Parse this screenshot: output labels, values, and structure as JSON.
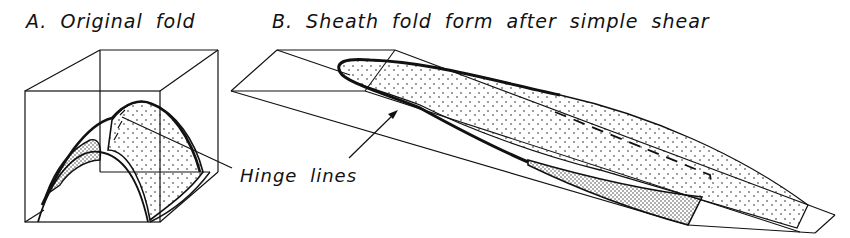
{
  "figure": {
    "panel_a": {
      "title": "A. Original fold"
    },
    "panel_b": {
      "title": "B. Sheath fold form after simple shear"
    },
    "annotation": {
      "hinge_label": "Hinge lines"
    },
    "colors": {
      "ink": "#111111",
      "background": "#ffffff"
    }
  }
}
